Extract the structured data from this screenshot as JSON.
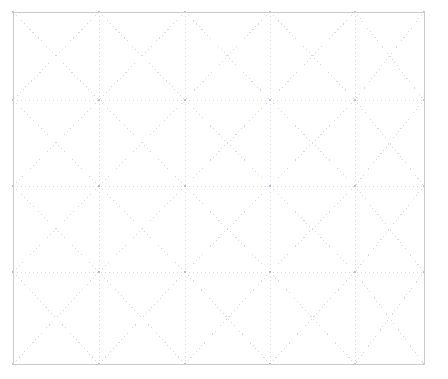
{
  "figure": {
    "canvas_width": 448,
    "canvas_height": 379,
    "background_color": "#ffffff"
  },
  "frame": {
    "name": "outer-border",
    "x": 13,
    "y": 12,
    "width": 411,
    "height": 352,
    "stroke_color": "#cccccc",
    "stroke_width": 1,
    "style": "solid",
    "fill": "none"
  },
  "grid": {
    "columns": 5,
    "rows": 4,
    "x_positions": [
      13,
      99,
      185,
      270,
      355,
      424
    ],
    "y_positions": [
      12,
      100,
      186,
      272,
      364
    ],
    "line_color": "#d9d9e2",
    "line_width": 1,
    "dash_pattern": "1 3",
    "show_vertical_lines": true,
    "show_horizontal_lines": true
  },
  "diagonals": {
    "enabled": true,
    "per_cell": 2,
    "directions": [
      "top-left-to-bottom-right",
      "top-right-to-bottom-left"
    ],
    "line_color": "#d9d9e2",
    "line_width": 1,
    "dash_pattern": "1 3",
    "triangles_per_cell": 4,
    "total_triangles": 80
  },
  "nodes": {
    "enabled": true,
    "color": "#b4b4c0",
    "radius": 1.1,
    "count": 30,
    "description": "grid line intersection points"
  },
  "chart_data": {
    "type": "scatter",
    "subtitle": "",
    "xlabel": "",
    "ylabel": "",
    "xlim": [
      0,
      5
    ],
    "ylim": [
      0,
      4
    ],
    "grid": true,
    "legend": "none",
    "x_ticks": [
      0,
      1,
      2,
      3,
      4,
      5
    ],
    "y_ticks": [
      0,
      1,
      2,
      3,
      4
    ],
    "x_tick_labels": [
      "",
      "",
      "",
      "",
      "",
      ""
    ],
    "y_tick_labels": [
      "",
      "",
      "",
      "",
      ""
    ],
    "annotations": [],
    "series": [
      {
        "name": "mesh-nodes",
        "marker": "point",
        "color": "#b4b4c0",
        "x": [
          0,
          1,
          2,
          3,
          4,
          5,
          0,
          1,
          2,
          3,
          4,
          5,
          0,
          1,
          2,
          3,
          4,
          5,
          0,
          1,
          2,
          3,
          4,
          5,
          0,
          1,
          2,
          3,
          4,
          5
        ],
        "y": [
          4,
          4,
          4,
          4,
          4,
          4,
          3,
          3,
          3,
          3,
          3,
          3,
          2,
          2,
          2,
          2,
          2,
          2,
          1,
          1,
          1,
          1,
          1,
          1,
          0,
          0,
          0,
          0,
          0,
          0
        ]
      }
    ]
  }
}
